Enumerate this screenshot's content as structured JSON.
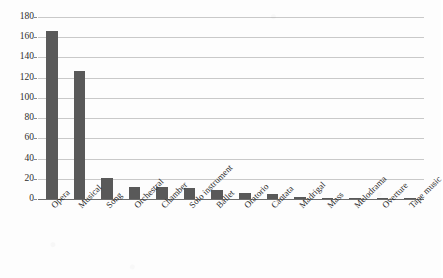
{
  "chart_data": {
    "type": "bar",
    "title": "",
    "subtitle": "",
    "xlabel": "",
    "ylabel": "",
    "ylim": [
      0,
      180
    ],
    "yticks": [
      0,
      20,
      40,
      60,
      80,
      100,
      120,
      140,
      160,
      180
    ],
    "grid": true,
    "legend": false,
    "legend_position": "none",
    "bar_color": "#595959",
    "gridline_color": "#c9c9c9",
    "axis_color": "#6d6d6d",
    "categories": [
      "Opera",
      "Musical",
      "Song",
      "Orchestral",
      "Chamber",
      "Solo instrument",
      "Ballet",
      "Oratorio",
      "Cantata",
      "Madrigal",
      "Mass",
      "Melodrama",
      "Overture",
      "Tape music"
    ],
    "values": [
      166,
      127,
      21,
      12,
      12,
      11,
      9,
      6,
      5,
      2,
      1,
      1,
      1,
      1
    ]
  }
}
